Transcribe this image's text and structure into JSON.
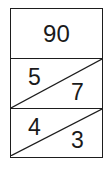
{
  "figure": {
    "type": "three-row-table-with-diagonals",
    "stroke_color": "#1d1d1d",
    "text_color": "#1a1a1a",
    "background_color": "#ffffff",
    "rows": [
      {
        "id": "row-top",
        "layout": "single-value",
        "has_diagonal": false,
        "center_value": "90"
      },
      {
        "id": "row-middle",
        "layout": "split-diagonal",
        "has_diagonal": true,
        "diagonal_direction": "bottom-left-to-top-right",
        "upper_left_value": "5",
        "lower_right_value": "7"
      },
      {
        "id": "row-bottom",
        "layout": "split-diagonal",
        "has_diagonal": true,
        "diagonal_direction": "bottom-left-to-top-right",
        "upper_left_value": "4",
        "lower_right_value": "3"
      }
    ]
  }
}
